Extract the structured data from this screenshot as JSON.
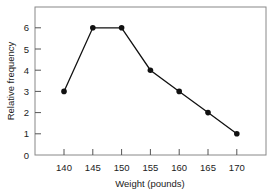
{
  "chart_data": {
    "type": "line",
    "title": "",
    "xlabel": "Weight (pounds)",
    "ylabel": "Relative frequency",
    "x": [
      140,
      145,
      150,
      155,
      160,
      165,
      170
    ],
    "values": [
      3,
      6,
      6,
      4,
      3,
      2,
      1
    ],
    "series": [
      {
        "name": "Relative frequency",
        "x": [
          140,
          145,
          150,
          155,
          160,
          165,
          170
        ],
        "values": [
          3,
          6,
          6,
          4,
          3,
          2,
          1
        ]
      }
    ],
    "xticks": [
      "140",
      "145",
      "150",
      "155",
      "160",
      "165",
      "170"
    ],
    "yticks": [
      "0",
      "1",
      "2",
      "3",
      "4",
      "5",
      "6"
    ],
    "xlim": [
      135,
      175
    ],
    "ylim": [
      0,
      7
    ],
    "grid": false,
    "legend": null,
    "marker": "filled-circle",
    "line_color": "#111111"
  }
}
